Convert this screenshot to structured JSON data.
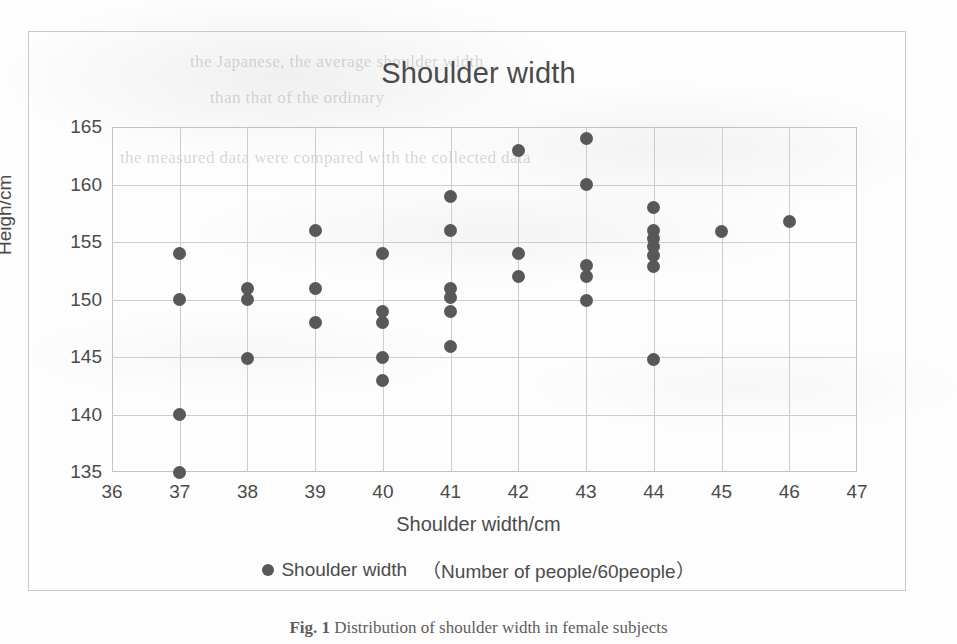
{
  "figure": {
    "title": "Shoulder width",
    "caption_label": "Fig. 1",
    "caption_text": "Distribution of shoulder width in female subjects"
  },
  "legend": {
    "marker": "dot-marker",
    "series_label": "Shoulder width",
    "note": "（Number of people/60people）"
  },
  "colors": {
    "marker": "#58585a",
    "grid": "#cdcdcf",
    "axis_text": "#4b4b4b",
    "frame": "#c9c9cb",
    "background": "#fdfdfd"
  },
  "chart_data": {
    "type": "scatter",
    "title": "Shoulder width",
    "xlabel": "Shoulder width/cm",
    "ylabel": "Heigh/cm",
    "xlim": [
      36,
      47
    ],
    "ylim": [
      135,
      165
    ],
    "xticks": [
      36,
      37,
      38,
      39,
      40,
      41,
      42,
      43,
      44,
      45,
      46,
      47
    ],
    "yticks": [
      135,
      140,
      145,
      150,
      155,
      160,
      165
    ],
    "grid": true,
    "legend_position": "bottom",
    "series": [
      {
        "name": "Shoulder width （Number of people/60people）",
        "color": "#58585a",
        "points": [
          [
            37,
            154.0
          ],
          [
            37,
            150.0
          ],
          [
            37,
            140.0
          ],
          [
            37,
            135.0
          ],
          [
            38,
            151.0
          ],
          [
            38,
            150.0
          ],
          [
            38,
            144.9
          ],
          [
            39,
            156.0
          ],
          [
            39,
            151.0
          ],
          [
            39,
            148.0
          ],
          [
            40,
            154.0
          ],
          [
            40,
            149.0
          ],
          [
            40,
            148.0
          ],
          [
            40,
            145.0
          ],
          [
            40,
            143.0
          ],
          [
            41,
            159.0
          ],
          [
            41,
            156.0
          ],
          [
            41,
            151.0
          ],
          [
            41,
            150.2
          ],
          [
            41,
            149.0
          ],
          [
            41,
            145.9
          ],
          [
            42,
            163.0
          ],
          [
            42,
            154.0
          ],
          [
            42,
            152.0
          ],
          [
            43,
            164.0
          ],
          [
            43,
            160.0
          ],
          [
            43,
            153.0
          ],
          [
            43,
            152.0
          ],
          [
            43,
            149.9
          ],
          [
            44,
            158.0
          ],
          [
            44,
            156.0
          ],
          [
            44,
            155.3
          ],
          [
            44,
            154.6
          ],
          [
            44,
            153.8
          ],
          [
            44,
            152.9
          ],
          [
            44,
            144.8
          ],
          [
            45,
            155.9
          ],
          [
            46,
            156.8
          ]
        ]
      }
    ]
  },
  "ghost_text": {
    "line1": "the Japanese, the average shoulder width",
    "line2": "than that of the ordinary",
    "line3": "the measured data were compared with the collected data"
  }
}
